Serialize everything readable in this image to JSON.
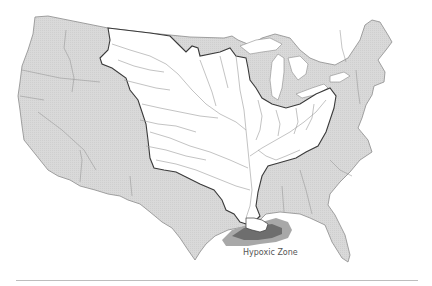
{
  "map": {
    "subject": "Mississippi River Basin and Gulf of Mexico hypoxic zone",
    "colors": {
      "land_outside_basin": "#d6d6d6",
      "basin_fill": "#ffffff",
      "state_border": "#8c8c8c",
      "basin_border": "#3a3a3a",
      "rivers": "#9a9a9a",
      "hypoxic_outer": "#9e9e9e",
      "hypoxic_inner": "#6e6e6e",
      "lakes": "#ffffff"
    },
    "labels": {
      "hypoxic_zone": "Hypoxic Zone"
    }
  }
}
